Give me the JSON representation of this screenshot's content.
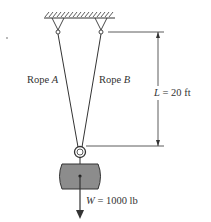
{
  "labels": {
    "rope_a_prefix": "Rope ",
    "rope_a_var": "A",
    "rope_b_prefix": "Rope ",
    "rope_b_var": "B",
    "length_var": "L",
    "length_value": " = 20 ft",
    "weight_var": "W",
    "weight_value": " = 1000 lb"
  },
  "colors": {
    "line": "#333333",
    "block_fill": "#8c8c8c",
    "block_stroke": "#333333"
  }
}
